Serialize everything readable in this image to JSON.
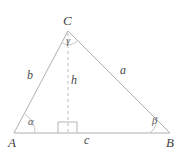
{
  "figure": {
    "kind": "triangle-altitude-diagram",
    "stroke_color": "#b0b0b0",
    "dashed_color": "#bdbdbd",
    "label_color": "#4a4a4a",
    "background": "#ffffff",
    "vertices": {
      "A": {
        "label": "A",
        "x": 14,
        "y": 133
      },
      "B": {
        "label": "B",
        "x": 170,
        "y": 133
      },
      "C": {
        "label": "C",
        "x": 68,
        "y": 31
      }
    },
    "sides": {
      "a": {
        "label": "a",
        "from": "C",
        "to": "B"
      },
      "b": {
        "label": "b",
        "from": "A",
        "to": "C"
      },
      "c": {
        "label": "c",
        "from": "A",
        "to": "B"
      }
    },
    "altitude": {
      "label": "h",
      "from": "C",
      "foot_x": 68,
      "foot_y": 133,
      "style": "dashed"
    },
    "angles": {
      "alpha": {
        "label": "α",
        "at": "A"
      },
      "beta": {
        "label": "β",
        "at": "B"
      },
      "gamma": {
        "label": "γ",
        "at": "C"
      }
    },
    "right_angle_marker": {
      "name": "right-angle-square",
      "x": 58,
      "y": 122,
      "size": 11
    }
  }
}
